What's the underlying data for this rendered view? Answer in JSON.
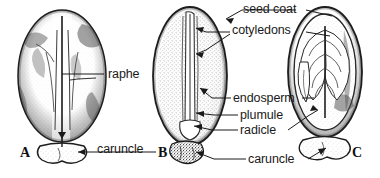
{
  "figure": {
    "background_color": "#ffffff",
    "ink_color": "#1a1a1a"
  },
  "panels": [
    {
      "id": "A",
      "label": "A",
      "caption": "external view of seed",
      "x": 20,
      "y": 145
    },
    {
      "id": "B",
      "label": "B",
      "caption": "longitudinal section",
      "x": 158,
      "y": 145
    },
    {
      "id": "C",
      "label": "C",
      "caption": "section showing cotyledons",
      "x": 352,
      "y": 145
    }
  ],
  "annotations": [
    {
      "id": "raphe",
      "text": "raphe",
      "x": 108,
      "y": 68,
      "target_panel": "A"
    },
    {
      "id": "caruncle-a",
      "text": "caruncle",
      "x": 97,
      "y": 143,
      "target_panel": "A"
    },
    {
      "id": "seed-coat",
      "text": "seed coat",
      "x": 243,
      "y": 3,
      "target_panel": "B"
    },
    {
      "id": "cotyledons",
      "text": "cotyledons",
      "x": 232,
      "y": 24,
      "target_panel": "B"
    },
    {
      "id": "endosperm",
      "text": "endosperm",
      "x": 233,
      "y": 92,
      "target_panel": "B"
    },
    {
      "id": "plumule",
      "text": "plumule",
      "x": 240,
      "y": 109,
      "target_panel": "B"
    },
    {
      "id": "radicle",
      "text": "radicle",
      "x": 240,
      "y": 124,
      "target_panel": "B"
    },
    {
      "id": "caruncle-b",
      "text": "caruncle",
      "x": 248,
      "y": 153,
      "target_panel": "B"
    }
  ]
}
